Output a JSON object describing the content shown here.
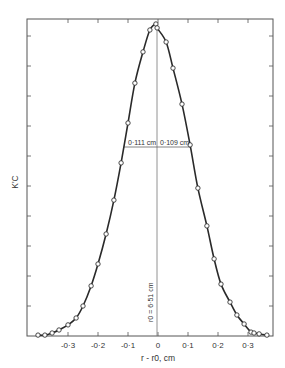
{
  "chart_data": {
    "type": "line",
    "title": "",
    "xlabel": "r - r0, cm",
    "ylabel": "K'C",
    "xlim": [
      -0.43,
      0.39
    ],
    "ylim": [
      0,
      10.6
    ],
    "grid": false,
    "legend": null,
    "x_ticks": [
      -0.3,
      -0.2,
      -0.1,
      0,
      0.1,
      0.2,
      0.3
    ],
    "x_tick_labels": [
      "-0·3",
      "-0·2",
      "-0·1",
      "0",
      "0·1",
      "0·2",
      "0·3"
    ],
    "y_ticks_unlabeled": 10,
    "series": [
      {
        "name": "measured points",
        "style": "open-circle markers with smooth curve",
        "x": [
          -0.4,
          -0.377,
          -0.353,
          -0.33,
          -0.3,
          -0.273,
          -0.25,
          -0.223,
          -0.2,
          -0.173,
          -0.147,
          -0.123,
          -0.1,
          -0.077,
          -0.05,
          -0.027,
          -0.007,
          -0.003,
          0.027,
          0.05,
          0.08,
          0.107,
          0.133,
          0.163,
          0.187,
          0.21,
          0.24,
          0.263,
          0.287,
          0.31,
          0.32,
          0.337,
          0.363
        ],
        "y": [
          0.03,
          0.03,
          0.1,
          0.2,
          0.37,
          0.6,
          1.0,
          1.67,
          2.4,
          3.4,
          4.53,
          5.77,
          7.1,
          8.43,
          9.47,
          10.2,
          10.4,
          10.27,
          9.8,
          8.93,
          7.73,
          6.37,
          4.93,
          3.67,
          2.57,
          1.73,
          1.13,
          0.7,
          0.4,
          0.13,
          0.1,
          0.07,
          0.03
        ]
      }
    ],
    "annotations": [
      {
        "text": "0·111 cm",
        "type": "half-width left",
        "at_y": 5.2
      },
      {
        "text": "0·109 cm",
        "type": "half-width right",
        "at_y": 5.2
      },
      {
        "text": "r0 = 6·51 cm",
        "type": "vertical line label",
        "at_x": 0
      }
    ]
  },
  "labels": {
    "xlabel": "r - r0, cm",
    "ylabel": "K'C",
    "half_left": "0·111 cm",
    "half_right": "0·109 cm",
    "center": "r0 = 6·51 cm",
    "xt0": "-0·3",
    "xt1": "-0·2",
    "xt2": "-0·1",
    "xt3": "0",
    "xt4": "0·1",
    "xt5": "0·2",
    "xt6": "0·3"
  }
}
